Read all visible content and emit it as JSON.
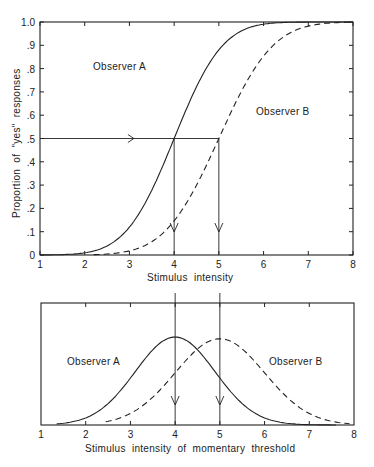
{
  "chart_data": [
    {
      "type": "line",
      "title": "",
      "xlabel": "Stimulus  intensity",
      "ylabel": "Proportion  of  \"yes\"  responses",
      "xlim": [
        1,
        8
      ],
      "ylim": [
        0,
        1.0
      ],
      "x_ticks": [
        "1",
        "2",
        "3",
        "4",
        "5",
        "6",
        "7",
        "8"
      ],
      "y_ticks": [
        "0",
        ".1",
        ".2",
        ".3",
        ".4",
        ".5",
        ".6",
        ".7",
        ".8",
        ".9",
        "1.0"
      ],
      "grid": false,
      "series": [
        {
          "name": "Observer A",
          "style": "solid",
          "kind": "cumulative-normal",
          "mean": 4,
          "sd": 0.85,
          "x": [
            1,
            2,
            3,
            4,
            5,
            6,
            7,
            8
          ],
          "values": [
            0.0,
            0.04,
            0.16,
            0.5,
            0.86,
            0.99,
            1.0,
            1.0
          ]
        },
        {
          "name": "Observer B",
          "style": "dashed",
          "kind": "cumulative-normal",
          "mean": 5,
          "sd": 0.95,
          "x": [
            2,
            3,
            4,
            5,
            6,
            7,
            8
          ],
          "values": [
            0.0,
            0.03,
            0.17,
            0.5,
            0.85,
            0.97,
            1.0
          ]
        }
      ],
      "annotations": [
        {
          "text": "Observer A",
          "x": 3.2,
          "y": 0.79
        },
        {
          "text": "Observer B",
          "x": 6.1,
          "y": 0.59
        },
        {
          "type": "horizontal-arrow",
          "y": 0.5,
          "from_x": 1,
          "to_x": 5
        },
        {
          "type": "vertical-arrow",
          "x": 4,
          "from_y": 0.5,
          "to_y": 0
        },
        {
          "type": "vertical-arrow",
          "x": 5,
          "from_y": 0.5,
          "to_y": 0
        }
      ]
    },
    {
      "type": "line",
      "title": "",
      "xlabel": "Stimulus  intensity  of  momentary  threshold",
      "ylabel": "",
      "xlim": [
        1,
        8
      ],
      "x_ticks": [
        "1",
        "2",
        "3",
        "4",
        "5",
        "6",
        "7",
        "8"
      ],
      "grid": false,
      "series": [
        {
          "name": "Observer A",
          "style": "solid",
          "kind": "normal-density",
          "mean": 4,
          "sd": 0.85,
          "peak_rel": 1.0
        },
        {
          "name": "Observer B",
          "style": "dashed",
          "kind": "normal-density",
          "mean": 5,
          "sd": 0.95,
          "peak_rel": 0.98
        }
      ],
      "annotations": [
        {
          "text": "Observer A",
          "x": 2.2
        },
        {
          "text": "Observer B",
          "x": 6.0
        },
        {
          "type": "vertical-arrow",
          "x": 4
        },
        {
          "type": "vertical-arrow",
          "x": 5
        }
      ]
    }
  ],
  "upper": {
    "xlabel": "Stimulus  intensity",
    "ylabel": "Proportion  of  \"yes\"  responses",
    "label_a": "Observer A",
    "label_b": "Observer B"
  },
  "lower": {
    "xlabel": "Stimulus  intensity  of  momentary  threshold",
    "label_a": "Observer A",
    "label_b": "Observer B"
  }
}
